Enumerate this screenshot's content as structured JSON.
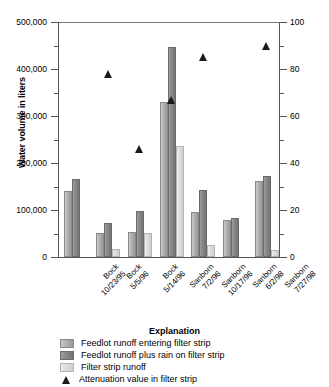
{
  "chart_data": {
    "type": "bar",
    "title": "",
    "xlabel": "",
    "ylabel": "Water volume in liters",
    "y2label": "Attenuation value in filter strip, in percent",
    "ylim": [
      0,
      500000
    ],
    "y2lim": [
      0,
      100
    ],
    "grid": false,
    "legend_position": "bottom",
    "legend_title": "Explanation",
    "y_ticks": [
      "0",
      "100,000",
      "200,000",
      "300,000",
      "400,000",
      "500,000"
    ],
    "y_tick_values": [
      0,
      100000,
      200000,
      300000,
      400000,
      500000
    ],
    "y_minor_step": 50000,
    "y2_ticks": [
      "0",
      "20",
      "40",
      "60",
      "80",
      "100"
    ],
    "y2_tick_values": [
      0,
      20,
      40,
      60,
      80,
      100
    ],
    "y2_minor_step": 10,
    "categories": [
      "Bock 10/23/95",
      "Bock 5/5/96",
      "Bock 5/14/96",
      "Sanborn 7/2/96",
      "Sanborn 10/17/96",
      "Sanborn 6/2/98",
      "Sanborn 7/27/98"
    ],
    "category_lines": [
      [
        "Bock",
        "10/23/95"
      ],
      [
        "Bock",
        "5/5/96"
      ],
      [
        "Bock",
        "5/14/96"
      ],
      [
        "Sanborn",
        "7/2/96"
      ],
      [
        "Sanborn",
        "10/17/96"
      ],
      [
        "Sanborn",
        "6/2/98"
      ],
      [
        "Sanborn",
        "7/27/98"
      ]
    ],
    "series": [
      {
        "name": "Feedlot runoff entering filter strip",
        "color": "#b0b0b0",
        "values": [
          141000,
          51000,
          54000,
          330000,
          95000,
          78000,
          161000
        ]
      },
      {
        "name": "Feedlot runoff plus rain on filter strip",
        "color": "#868686",
        "values": [
          166000,
          73000,
          97000,
          447000,
          143000,
          84000,
          172000
        ]
      },
      {
        "name": "Filter strip runoff",
        "color": "#dcdcdc",
        "values": [
          0,
          17000,
          51000,
          236000,
          26000,
          0,
          14000
        ]
      }
    ],
    "marker_series": {
      "name": "Attenuation value in filter strip",
      "color": "#1a1a1a",
      "marker": "triangle",
      "axis": "secondary",
      "values": [
        null,
        78,
        46,
        67,
        85,
        null,
        90
      ]
    }
  },
  "legend": {
    "title": "Explanation",
    "entries": [
      {
        "swatch": "s0",
        "label": "Feedlot runoff entering filter strip"
      },
      {
        "swatch": "s1",
        "label": "Feedlot runoff plus rain on filter strip"
      },
      {
        "swatch": "s2",
        "label": "Filter strip runoff"
      },
      {
        "swatch": "triangle",
        "label": "Attenuation value in filter strip"
      }
    ]
  }
}
